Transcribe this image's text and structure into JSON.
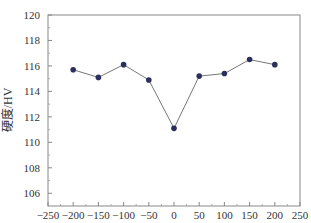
{
  "chart_data": {
    "type": "line",
    "title": "",
    "xlabel": "",
    "ylabel": "硬度/HV",
    "xlim": [
      -250,
      250
    ],
    "ylim": [
      105,
      120
    ],
    "x_ticks": [
      -250,
      -200,
      -150,
      -100,
      -50,
      0,
      50,
      100,
      150,
      200,
      250
    ],
    "x_tick_labels": [
      "−250",
      "−200",
      "−150",
      "−100",
      "−50",
      "0",
      "50",
      "100",
      "150",
      "200",
      "250"
    ],
    "y_ticks": [
      106,
      108,
      110,
      112,
      114,
      116,
      118,
      120
    ],
    "y_tick_labels": [
      "106",
      "108",
      "110",
      "112",
      "114",
      "116",
      "118",
      "120"
    ],
    "grid": false,
    "legend": "none",
    "series": [
      {
        "name": "硬度",
        "color": "#2a2f5e",
        "line_color": "#777777",
        "x": [
          -200,
          -150,
          -100,
          -50,
          0,
          50,
          100,
          150,
          200
        ],
        "y": [
          115.7,
          115.1,
          116.1,
          114.9,
          111.1,
          115.2,
          115.4,
          116.5,
          116.1
        ]
      }
    ]
  }
}
